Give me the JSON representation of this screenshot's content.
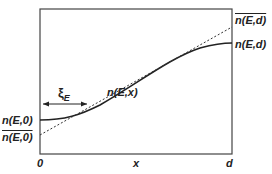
{
  "labels": {
    "n_E_0": "n(E,0)",
    "nbar_E_0": "n(E,0)",
    "n_E_x": "n(E,x)",
    "n_E_d": "n(E,d)",
    "nbar_E_d": "n(E,d)",
    "xi": "ξ",
    "xi_sub": "E",
    "x_origin": "0",
    "x_axis": "x",
    "x_end": "d"
  },
  "colors": {
    "line": "#222222",
    "frame": "#444444"
  }
}
